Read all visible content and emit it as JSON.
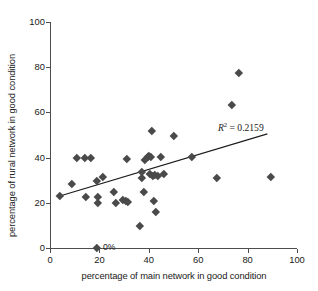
{
  "chart_data": {
    "type": "scatter",
    "title": "",
    "xlabel": "percentage of main network in good condition",
    "ylabel": "percentage of rural network in good condition",
    "xlim": [
      0,
      100
    ],
    "ylim": [
      0,
      100
    ],
    "xticks": [
      0,
      20,
      40,
      60,
      80,
      100
    ],
    "yticks": [
      0,
      20,
      40,
      60,
      80,
      100
    ],
    "grid": false,
    "legend": null,
    "marker": "diamond",
    "marker_color": "#4a4a4a",
    "points": [
      [
        4.0,
        23.0
      ],
      [
        9.0,
        28.3
      ],
      [
        11.0,
        40.0
      ],
      [
        14.0,
        40.0
      ],
      [
        14.5,
        22.6
      ],
      [
        16.5,
        40.0
      ],
      [
        19.0,
        29.7
      ],
      [
        19.3,
        22.6
      ],
      [
        19.5,
        20.2
      ],
      [
        19.0,
        0.0
      ],
      [
        21.5,
        31.5
      ],
      [
        26.0,
        24.8
      ],
      [
        26.5,
        20.2
      ],
      [
        29.5,
        21.5
      ],
      [
        30.5,
        21.0
      ],
      [
        31.0,
        39.6
      ],
      [
        31.5,
        20.3
      ],
      [
        36.5,
        10.0
      ],
      [
        37.0,
        33.8
      ],
      [
        37.3,
        31.2
      ],
      [
        38.0,
        24.9
      ],
      [
        38.5,
        39.2
      ],
      [
        39.5,
        40.2
      ],
      [
        40.0,
        40.6
      ],
      [
        40.3,
        32.9
      ],
      [
        41.0,
        40.3
      ],
      [
        41.2,
        51.8
      ],
      [
        41.5,
        32.1
      ],
      [
        42.0,
        21.0
      ],
      [
        42.5,
        32.3
      ],
      [
        43.0,
        16.2
      ],
      [
        43.5,
        31.9
      ],
      [
        45.0,
        40.2
      ],
      [
        46.0,
        32.8
      ],
      [
        50.0,
        49.5
      ],
      [
        57.5,
        40.2
      ],
      [
        67.5,
        31.2
      ],
      [
        73.8,
        63.3
      ],
      [
        76.5,
        77.5
      ],
      [
        89.5,
        31.3
      ]
    ],
    "trendline": {
      "x0": 4.0,
      "y0": 23.0,
      "x1": 88.0,
      "y1": 50.5,
      "color": "#1a1a1a"
    },
    "annotations": [
      {
        "name": "r2-annotation",
        "text_prefix": "R",
        "text_sup": "2",
        "text_suffix": " = 0.2159",
        "x": 68.0,
        "y": 53.5
      },
      {
        "name": "zero-percent-annotation",
        "text": "0%",
        "x": 21.5,
        "y": 0.0
      }
    ]
  }
}
